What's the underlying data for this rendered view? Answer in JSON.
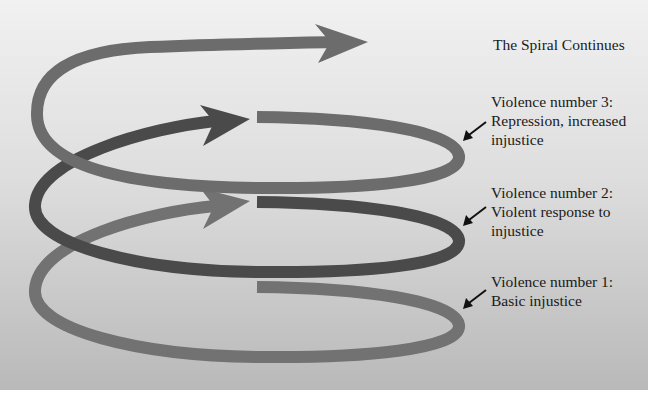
{
  "diagram": {
    "title": "The Spiral Continues",
    "colors": {
      "background_top": "#f1f1f1",
      "background_bottom": "#b9b9b9",
      "coil_1": "#727272",
      "coil_2": "#4a4a4a",
      "coil_3": "#6c6c6c",
      "pointer_arrow": "#111111",
      "text": "#1a1a1a"
    },
    "stages": [
      {
        "number": 1,
        "line1": "Violence number 1:",
        "line2": "Basic injustice",
        "line3": ""
      },
      {
        "number": 2,
        "line1": "Violence number 2:",
        "line2": "Violent response to",
        "line3": "injustice"
      },
      {
        "number": 3,
        "line1": "Violence number 3:",
        "line2": "Repression, increased",
        "line3": "injustice"
      }
    ]
  }
}
